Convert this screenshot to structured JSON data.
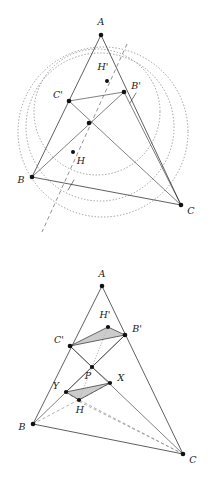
{
  "document": {
    "title": "Two geometric constructions on triangle ABC",
    "background_color": "#ffffff",
    "ink_color": "#1a1a1a",
    "shade_color": "#b9b9b9",
    "dotted_color": "#8c8c8c",
    "width": 215,
    "height": 480
  },
  "figures": [
    {
      "id": "figure-top",
      "name": "circles-and-euler-line-figure",
      "labels": {
        "A": "A",
        "B": "B",
        "C": "C",
        "A_prime": "A'",
        "B_prime": "B'",
        "C_prime": "C'",
        "H": "H",
        "H_prime": "H'"
      },
      "points": {
        "A": {
          "x": 101,
          "y": 35,
          "label": "A",
          "label_x": 101,
          "label_y": 25,
          "shown": true
        },
        "B": {
          "x": 32,
          "y": 177,
          "label": "B",
          "label_x": 21,
          "label_y": 183,
          "shown": true
        },
        "C": {
          "x": 181,
          "y": 205,
          "label": "C",
          "label_x": 191,
          "label_y": 214,
          "shown": true
        },
        "Bp": {
          "x": 124,
          "y": 92,
          "label": "B'",
          "label_x": 134,
          "label_y": 89,
          "shown": true
        },
        "Cp": {
          "x": 69,
          "y": 101,
          "label": "C'",
          "label_x": 58,
          "label_y": 98,
          "shown": true
        },
        "Hp": {
          "x": 107,
          "y": 81,
          "label": "H'",
          "label_x": 103,
          "label_y": 70,
          "shown": true
        },
        "H": {
          "x": 73,
          "y": 152,
          "label": "H",
          "label_x": 79,
          "label_y": 164,
          "shown": true
        },
        "M": {
          "x": 89,
          "y": 123,
          "label": "",
          "label_x": 0,
          "label_y": 0,
          "shown": true
        }
      },
      "segments": [
        {
          "from": "A",
          "to": "B",
          "style": "solid"
        },
        {
          "from": "A",
          "to": "C",
          "style": "solid"
        },
        {
          "from": "B",
          "to": "C",
          "style": "solid"
        },
        {
          "from": "Cp",
          "to": "Bp",
          "style": "solid"
        },
        {
          "from": "Cp",
          "to": "C",
          "style": "solid"
        },
        {
          "from": "Bp",
          "to": "B",
          "style": "solid"
        },
        {
          "from": "Bp",
          "to": "C",
          "style": "solid"
        }
      ],
      "dashed_line": {
        "x1": 127,
        "y1": 44,
        "x2": 42,
        "y2": 232,
        "name": "euler-dashed-line"
      },
      "tick_marks": [
        {
          "x": 71,
          "y": 185,
          "angle": 70
        },
        {
          "x": 133,
          "y": 98,
          "angle": 70
        }
      ],
      "circles": [
        {
          "cx": 103,
          "cy": 132,
          "r": 85,
          "name": "circumcircle"
        },
        {
          "cx": 100,
          "cy": 127,
          "r": 74,
          "name": "second-dotted-circle"
        },
        {
          "cx": 97,
          "cy": 112,
          "r": 63,
          "name": "nine-point-circle"
        }
      ]
    },
    {
      "id": "figure-bottom",
      "name": "shaded-triangles-figure",
      "labels": {
        "A": "A",
        "B": "B",
        "C": "C",
        "B_prime": "B'",
        "C_prime": "C'",
        "H": "H",
        "H_prime": "H'",
        "P": "P",
        "X": "X",
        "Y": "Y"
      },
      "points": {
        "A": {
          "x": 102,
          "y": 286,
          "label": "A",
          "label_x": 102,
          "label_y": 276,
          "shown": true
        },
        "B": {
          "x": 33,
          "y": 424,
          "label": "B",
          "label_x": 22,
          "label_y": 430,
          "shown": true
        },
        "C": {
          "x": 183,
          "y": 454,
          "label": "C",
          "label_x": 193,
          "label_y": 463,
          "shown": true
        },
        "Bp": {
          "x": 125,
          "y": 335,
          "label": "B'",
          "label_x": 136,
          "label_y": 332,
          "shown": true
        },
        "Cp": {
          "x": 70,
          "y": 346,
          "label": "C'",
          "label_x": 59,
          "label_y": 343,
          "shown": true
        },
        "Hp": {
          "x": 108,
          "y": 327,
          "label": "H'",
          "label_x": 104,
          "label_y": 318,
          "shown": true
        },
        "P": {
          "x": 92,
          "y": 367,
          "label": "P",
          "label_x": 90,
          "label_y": 379,
          "shown": true
        },
        "X": {
          "x": 110,
          "y": 383,
          "label": "X",
          "label_x": 120,
          "label_y": 381,
          "shown": true
        },
        "Y": {
          "x": 66,
          "y": 392,
          "label": "Y",
          "label_x": 56,
          "label_y": 389,
          "shown": true
        },
        "H": {
          "x": 79,
          "y": 400,
          "label": "H",
          "label_x": 79,
          "label_y": 412,
          "shown": true
        }
      },
      "segments": [
        {
          "from": "A",
          "to": "B",
          "style": "solid"
        },
        {
          "from": "A",
          "to": "C",
          "style": "solid"
        },
        {
          "from": "B",
          "to": "C",
          "style": "solid"
        },
        {
          "from": "Cp",
          "to": "C",
          "style": "solid"
        },
        {
          "from": "Bp",
          "to": "B",
          "style": "solid"
        },
        {
          "from": "B",
          "to": "X",
          "style": "dashed"
        },
        {
          "from": "C",
          "to": "Y",
          "style": "dashed"
        },
        {
          "from": "C",
          "to": "H",
          "style": "dashed"
        }
      ],
      "shaded_triangles": [
        {
          "name": "upper-shaded-triangle",
          "vertices": [
            "Cp",
            "Hp",
            "Bp"
          ]
        },
        {
          "name": "lower-shaded-triangle",
          "vertices": [
            "Y",
            "H",
            "X"
          ]
        }
      ],
      "dotted_connectors": [
        {
          "from": "Hp",
          "to": "P",
          "name": "hprime-p-dotted"
        },
        {
          "from": "P",
          "to": "H",
          "name": "p-h-dotted"
        }
      ]
    }
  ]
}
